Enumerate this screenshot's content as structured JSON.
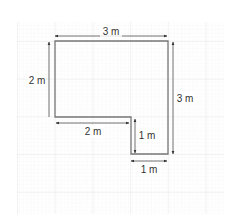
{
  "diagram": {
    "unit": "m",
    "labels": {
      "top": "3 m",
      "left": "2 m",
      "right": "3 m",
      "bottom_left": "2 m",
      "notch_height": "1 m",
      "bottom_right": "1 m"
    },
    "colors": {
      "grid_minor": "#ececec",
      "grid_major": "#dcdcdc",
      "shape_stroke": "#777777",
      "arrow": "#333333",
      "text": "#333333"
    }
  }
}
